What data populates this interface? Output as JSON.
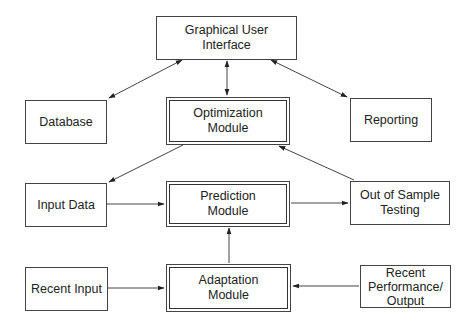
{
  "diagram": {
    "nodes": {
      "gui": {
        "label": "Graphical User\nInterface"
      },
      "database": {
        "label": "Database"
      },
      "optimization": {
        "label": "Optimization\nModule"
      },
      "reporting": {
        "label": "Reporting"
      },
      "input_data": {
        "label": "Input Data"
      },
      "prediction": {
        "label": "Prediction\nModule"
      },
      "out_of_sample": {
        "label": "Out of Sample\nTesting"
      },
      "recent_input": {
        "label": "Recent Input"
      },
      "adaptation": {
        "label": "Adaptation\nModule"
      },
      "recent_performance": {
        "label": "Recent\nPerformance/\nOutput"
      }
    },
    "edges": [
      {
        "from": "gui",
        "to": "database",
        "direction": "both"
      },
      {
        "from": "gui",
        "to": "optimization",
        "direction": "both"
      },
      {
        "from": "gui",
        "to": "reporting",
        "direction": "both"
      },
      {
        "from": "optimization",
        "to": "input_data",
        "direction": "forward"
      },
      {
        "from": "out_of_sample",
        "to": "optimization",
        "direction": "forward"
      },
      {
        "from": "input_data",
        "to": "prediction",
        "direction": "forward"
      },
      {
        "from": "prediction",
        "to": "out_of_sample",
        "direction": "forward"
      },
      {
        "from": "adaptation",
        "to": "prediction",
        "direction": "forward"
      },
      {
        "from": "recent_input",
        "to": "adaptation",
        "direction": "forward"
      },
      {
        "from": "recent_performance",
        "to": "adaptation",
        "direction": "forward"
      }
    ]
  }
}
